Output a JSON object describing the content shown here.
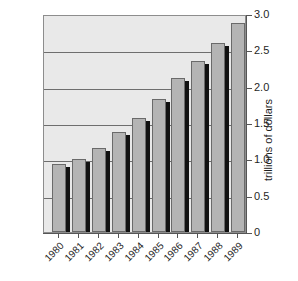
{
  "chart_data": {
    "type": "bar",
    "title": "",
    "subtitle": "",
    "xlabel": "",
    "ylabel": "trillions of dollars",
    "categories": [
      "1980",
      "1981",
      "1982",
      "1983",
      "1984",
      "1985",
      "1986",
      "1987",
      "1988",
      "1989"
    ],
    "values": [
      0.93,
      1.0,
      1.15,
      1.38,
      1.57,
      1.83,
      2.12,
      2.35,
      2.6,
      2.88
    ],
    "series": [
      {
        "name": "trillions of dollars",
        "values": [
          0.93,
          1.0,
          1.15,
          1.38,
          1.57,
          1.83,
          2.12,
          2.35,
          2.6,
          2.88
        ]
      }
    ],
    "ylim": [
      0,
      3.0
    ],
    "y_ticks": [
      0,
      0.5,
      1.0,
      1.5,
      2.0,
      2.5,
      3.0
    ],
    "y_tick_labels": [
      "0",
      "0.5",
      "1.0",
      "1.5",
      "2.0",
      "2.5",
      "3.0"
    ],
    "grid": true,
    "grid_axis": "y",
    "legend": false,
    "legend_position": "none",
    "annotations": [],
    "axis_side": "right",
    "xtick_rotation_deg": -45,
    "colors": {
      "bar_fill": "#b4b4b4",
      "bar_edge": "#6a6a6a",
      "bar_shadow": "#111111",
      "plot_background": "#e9e9e9",
      "gridline": "#6e6e6e",
      "axis": "#555555",
      "text": "#1f1f1f",
      "figure_background": "#ffffff"
    }
  },
  "ghost": {
    "line1": "",
    "line2": ""
  }
}
